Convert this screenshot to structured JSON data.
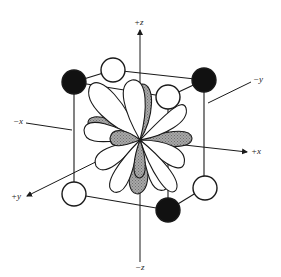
{
  "diagram": {
    "axes": {
      "pz": "+z",
      "nz": "−z",
      "px": "+x",
      "nx": "−x",
      "py": "+y",
      "ny": "−y"
    },
    "colors": {
      "line": "#1a1a1a",
      "filled_sphere": "#111111",
      "open_sphere": "#ffffff",
      "shaded_lobe": "#9a9a9a",
      "open_lobe": "#ffffff"
    }
  }
}
